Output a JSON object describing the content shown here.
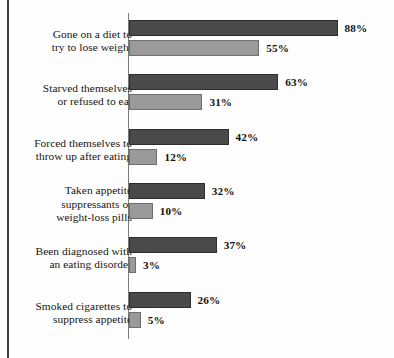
{
  "chart_data": {
    "type": "bar",
    "orientation": "horizontal",
    "title": "",
    "subtitle": "",
    "xlabel": "",
    "ylabel": "",
    "xlim": [
      0,
      100
    ],
    "grid": false,
    "legend": "none",
    "value_suffix": "%",
    "categories": [
      "Gone on a diet to try to lose weight",
      "Starved themselves or refused to eat",
      "Forced themselves to throw up after eating",
      "Taken appetite suppressants or weight-loss pills",
      "Been diagnosed with an eating disorder",
      "Smoked cigarettes to suppress appetite"
    ],
    "series": [
      {
        "name": "series-1",
        "color": "#4a4a4a",
        "values": [
          88,
          63,
          42,
          32,
          37,
          26
        ]
      },
      {
        "name": "series-2",
        "color": "#9a9a9a",
        "values": [
          55,
          31,
          12,
          10,
          3,
          5
        ]
      }
    ]
  },
  "rows": [
    {
      "label_lines": [
        "Gone on a diet to",
        "try to lose weight"
      ],
      "dark_value": 88,
      "dark_label": "88%",
      "light_value": 55,
      "light_label": "55%"
    },
    {
      "label_lines": [
        "Starved themselves",
        "or refused to eat"
      ],
      "dark_value": 63,
      "dark_label": "63%",
      "light_value": 31,
      "light_label": "31%"
    },
    {
      "label_lines": [
        "Forced themselves to",
        "throw up after eating"
      ],
      "dark_value": 42,
      "dark_label": "42%",
      "light_value": 12,
      "light_label": "12%"
    },
    {
      "label_lines": [
        "Taken appetite",
        "suppressants or",
        "weight-loss pills"
      ],
      "dark_value": 32,
      "dark_label": "32%",
      "light_value": 10,
      "light_label": "10%"
    },
    {
      "label_lines": [
        "Been diagnosed with",
        "an eating disorder"
      ],
      "dark_value": 37,
      "dark_label": "37%",
      "light_value": 3,
      "light_label": "3%"
    },
    {
      "label_lines": [
        "Smoked cigarettes to",
        "suppress appetite"
      ],
      "dark_value": 26,
      "dark_label": "26%",
      "light_value": 5,
      "light_label": "5%"
    }
  ],
  "style": {
    "dark_bar_color": "#4a4a4a",
    "light_bar_color": "#9a9a9a",
    "axis_color": "#7a7a7a",
    "frame_color": "#3c3c3c",
    "text_color": "#151515",
    "background": "#fefefe",
    "px_per_percent": 2.37
  }
}
